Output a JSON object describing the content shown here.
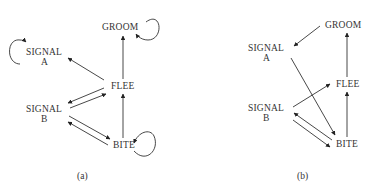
{
  "panels": [
    {
      "caption": "(a)",
      "nodes": {
        "groom": "GROOM",
        "signal_a_1": "SIGNAL",
        "signal_a_2": "A",
        "flee": "FLEE",
        "signal_b_1": "SIGNAL",
        "signal_b_2": "B",
        "bite": "BITE"
      },
      "edges": [
        {
          "from": "FLEE",
          "to": "GROOM"
        },
        {
          "from": "GROOM",
          "to": "GROOM"
        },
        {
          "from": "SIGNAL A",
          "to": "SIGNAL A"
        },
        {
          "from": "FLEE",
          "to": "SIGNAL A"
        },
        {
          "from": "FLEE",
          "to": "SIGNAL B"
        },
        {
          "from": "SIGNAL B",
          "to": "FLEE"
        },
        {
          "from": "SIGNAL B",
          "to": "BITE"
        },
        {
          "from": "BITE",
          "to": "SIGNAL B"
        },
        {
          "from": "BITE",
          "to": "FLEE"
        },
        {
          "from": "BITE",
          "to": "BITE"
        }
      ]
    },
    {
      "caption": "(b)",
      "nodes": {
        "groom": "GROOM",
        "signal_a_1": "SIGNAL",
        "signal_a_2": "A",
        "flee": "FLEE",
        "signal_b_1": "SIGNAL",
        "signal_b_2": "B",
        "bite": "BITE"
      },
      "edges": [
        {
          "from": "GROOM",
          "to": "SIGNAL A"
        },
        {
          "from": "FLEE",
          "to": "GROOM"
        },
        {
          "from": "SIGNAL A",
          "to": "BITE"
        },
        {
          "from": "SIGNAL B",
          "to": "FLEE"
        },
        {
          "from": "BITE",
          "to": "SIGNAL B"
        },
        {
          "from": "SIGNAL B",
          "to": "BITE"
        },
        {
          "from": "BITE",
          "to": "FLEE"
        }
      ]
    }
  ]
}
